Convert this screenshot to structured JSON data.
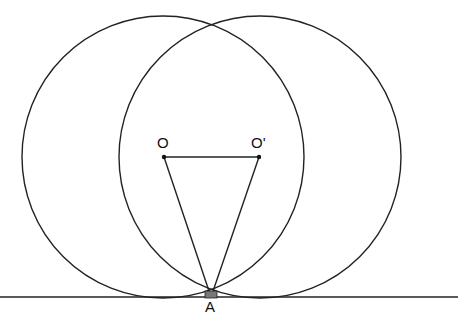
{
  "diagram": {
    "points": {
      "O": {
        "label": "O"
      },
      "O_prime": {
        "label": "O'"
      },
      "A": {
        "label": "A"
      }
    },
    "colors": {
      "stroke": "#222222",
      "background": "#ffffff",
      "marker_fill": "#777777"
    }
  }
}
